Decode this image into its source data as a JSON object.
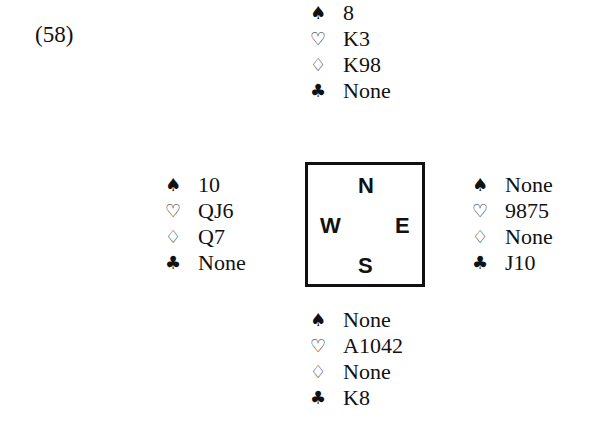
{
  "problem_number": "(58)",
  "suit_symbols": {
    "spades": "♠",
    "hearts": "♡",
    "diamonds": "♢",
    "clubs": "♣"
  },
  "hands": {
    "north": {
      "spades": "8",
      "hearts": "K3",
      "diamonds": "K98",
      "clubs": "None"
    },
    "west": {
      "spades": "10",
      "hearts": "QJ6",
      "diamonds": "Q7",
      "clubs": "None"
    },
    "east": {
      "spades": "None",
      "hearts": "9875",
      "diamonds": "None",
      "clubs": "J10"
    },
    "south": {
      "spades": "None",
      "hearts": "A1042",
      "diamonds": "None",
      "clubs": "K8"
    }
  },
  "compass": {
    "north": "N",
    "west": "W",
    "east": "E",
    "south": "S"
  }
}
